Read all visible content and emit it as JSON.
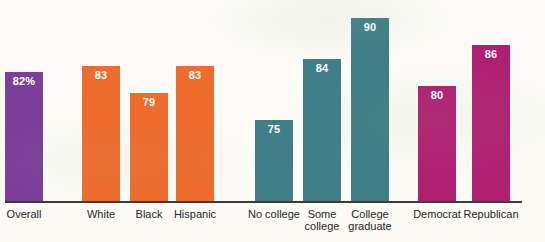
{
  "chart_data": {
    "type": "bar",
    "title": "",
    "xlabel": "",
    "ylabel": "",
    "categories": [
      "Overall",
      "White",
      "Black",
      "Hispanic",
      "No college",
      "Some college",
      "College graduate",
      "Democrat",
      "Republican"
    ],
    "values": [
      82,
      83,
      79,
      83,
      75,
      84,
      90,
      80,
      86
    ],
    "value_labels": [
      "82%",
      "83",
      "79",
      "83",
      "75",
      "84",
      "90",
      "80",
      "86"
    ],
    "bar_colors": [
      "#7b3f9a",
      "#ee6c2d",
      "#ee6c2d",
      "#ee6c2d",
      "#3f7e86",
      "#3f7e86",
      "#3f7e86",
      "#af2073",
      "#af2073"
    ],
    "groups": [
      {
        "name": "overall",
        "color": "#7b3f9a",
        "members": [
          "Overall"
        ]
      },
      {
        "name": "race-ethnicity",
        "color": "#ee6c2d",
        "members": [
          "White",
          "Black",
          "Hispanic"
        ]
      },
      {
        "name": "education",
        "color": "#3f7e86",
        "members": [
          "No college",
          "Some college",
          "College graduate"
        ]
      },
      {
        "name": "party",
        "color": "#af2073",
        "members": [
          "Democrat",
          "Republican"
        ]
      }
    ],
    "value_label_color": "#ffffff",
    "axis_color": "#3b3b3b",
    "ylim": [
      63,
      91
    ],
    "grid": false,
    "legend": "none"
  }
}
